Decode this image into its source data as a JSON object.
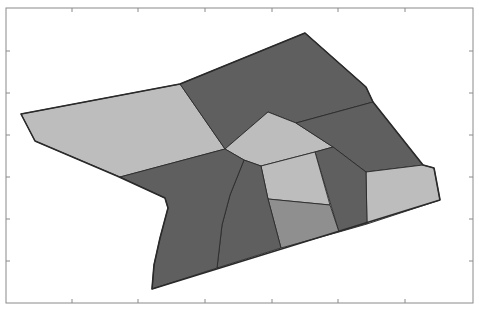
{
  "figure": {
    "width": 479,
    "height": 316,
    "background": "#ffffff",
    "frame": {
      "x": 6,
      "y": 8,
      "width": 467,
      "height": 295,
      "stroke": "#8a8a8a"
    },
    "x_ticks": [
      72,
      138,
      205,
      272,
      338,
      405
    ],
    "y_ticks": [
      51,
      93,
      135,
      177,
      219,
      261
    ],
    "tick_labels_visible": false,
    "colors": {
      "light": "#bdbdbd",
      "medium": "#8f8f8f",
      "dark": "#5f5f5f",
      "edge": "#2a2a2a"
    }
  },
  "chart_data": {
    "type": "voronoi-partition",
    "title": "",
    "xlabel": "",
    "ylabel": "",
    "axis_tick_count": {
      "x": 6,
      "y": 6
    },
    "cells": [
      {
        "id": "left-light",
        "shade": "light",
        "points": "21,114 180,84 225,149 120,177 35,141"
      },
      {
        "id": "top-dark",
        "shade": "dark",
        "points": "180,84 305,33 366,87 373,102 296,123 268,112 225,149"
      },
      {
        "id": "center-pentagon",
        "shade": "light",
        "points": "225,149 268,112 296,123 333,147 315,152 261,166 244,160"
      },
      {
        "id": "right-dark",
        "shade": "dark",
        "points": "296,123 373,102 423,165 366,172 333,147"
      },
      {
        "id": "right-light",
        "shade": "light",
        "points": "366,172 423,165 434,168 440,200 367,224"
      },
      {
        "id": "right-strip-dark",
        "shade": "dark",
        "points": "315,152 333,147 366,172 367,224 339,232"
      },
      {
        "id": "center-small-light",
        "shade": "light",
        "points": "261,166 315,152 330,205 268,199"
      },
      {
        "id": "lower-mid-medium",
        "shade": "medium",
        "points": "268,199 330,205 339,232 281,248"
      },
      {
        "id": "lower-mid-dark",
        "shade": "dark",
        "points": "244,160 261,166 268,199 281,248 217,268 222,225 230,195"
      },
      {
        "id": "lower-left-dark",
        "shade": "dark",
        "points": "120,177 225,149 244,160 230,195 222,225 217,268 152,289 154,265 160,238 168,208 165,198"
      }
    ],
    "outline": "21,114 180,84 305,33 366,87 373,102 423,165 434,168 440,200 152,289 154,265 160,238 168,208 165,198 117,176 35,141"
  }
}
